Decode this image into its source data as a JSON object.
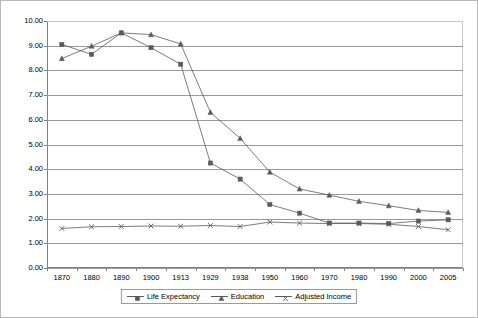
{
  "chart_data": {
    "type": "line",
    "title": "",
    "xlabel": "",
    "ylabel": "",
    "categories": [
      "1870",
      "1880",
      "1890",
      "1900",
      "1913",
      "1929",
      "1938",
      "1950",
      "1960",
      "1970",
      "1980",
      "1990",
      "2000",
      "2005"
    ],
    "ylim": [
      0,
      10
    ],
    "ytick_step": 1.0,
    "ytick_labels": [
      "0.00",
      "1.00",
      "2.00",
      "3.00",
      "4.00",
      "5.00",
      "6.00",
      "7.00",
      "8.00",
      "9.00",
      "10.00"
    ],
    "grid": "horizontal",
    "legend_position": "bottom-center",
    "series": [
      {
        "name": "Life Expectancy",
        "marker": "square",
        "color": "#5a5a5a",
        "values": [
          9.05,
          8.65,
          9.52,
          8.92,
          8.25,
          4.25,
          3.6,
          2.57,
          2.22,
          1.82,
          1.82,
          1.8,
          1.9,
          1.95
        ]
      },
      {
        "name": "Education",
        "marker": "triangle",
        "color": "#5a5a5a",
        "values": [
          8.48,
          8.98,
          9.52,
          9.45,
          9.07,
          6.3,
          5.25,
          3.88,
          3.2,
          2.95,
          2.7,
          2.52,
          2.33,
          2.25
        ]
      },
      {
        "name": "Adjusted Income",
        "marker": "cross",
        "color": "#5a5a5a",
        "values": [
          1.6,
          1.67,
          1.68,
          1.7,
          1.69,
          1.72,
          1.68,
          1.86,
          1.82,
          1.8,
          1.8,
          1.77,
          1.68,
          1.55
        ]
      }
    ]
  },
  "legend": {
    "items": [
      {
        "label": "Life Expectancy"
      },
      {
        "label": "Education"
      },
      {
        "label": "Adjusted Income"
      }
    ]
  }
}
